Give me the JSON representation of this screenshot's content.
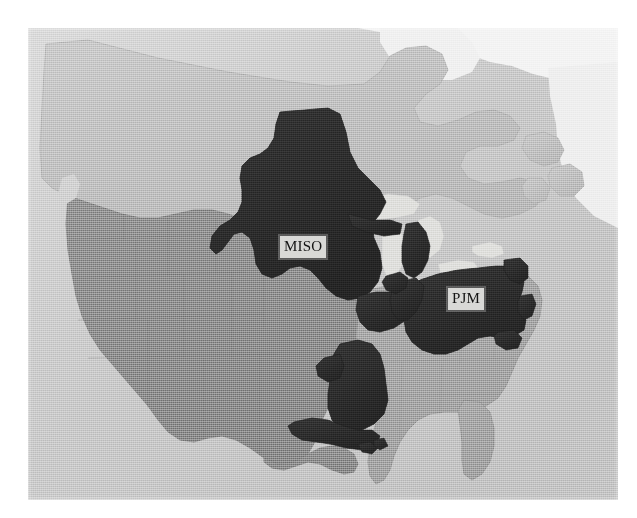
{
  "figure": {
    "kind": "map",
    "width": 637,
    "height": 518,
    "background_color": "#ffffff"
  },
  "map": {
    "plate": {
      "left": 28,
      "top": 28,
      "width": 590,
      "height": 472
    },
    "colors": {
      "page_background": "#ffffff",
      "ocean": "#c9c9c9",
      "water_light": "#e6e6e6",
      "great_lakes": "#d2d2d2",
      "canada_fill": "#bdbdbd",
      "us_base_fill": "#8c8c8c",
      "southeast_fill": "#a3a3a3",
      "rto_highlight_fill": "#2b2b2b",
      "state_border": "#7a7a7a",
      "label_box_fill": "#d8d8d6",
      "label_box_border": "#5a5a5a",
      "label_text": "#141414"
    },
    "labels": [
      {
        "id": "miso",
        "text": "MISO",
        "x": 279,
        "y": 235,
        "region": "Midcontinent Independent System Operator"
      },
      {
        "id": "pjm",
        "text": "PJM",
        "x": 447,
        "y": 287,
        "region": "PJM Interconnection"
      }
    ],
    "regions": [
      {
        "id": "miso-north",
        "name": "MISO northern footprint",
        "shade": "rto_highlight_fill"
      },
      {
        "id": "miso-south",
        "name": "MISO southern footprint",
        "shade": "rto_highlight_fill"
      },
      {
        "id": "pjm",
        "name": "PJM footprint",
        "shade": "rto_highlight_fill"
      },
      {
        "id": "western-us",
        "name": "Western United States",
        "shade": "us_base_fill"
      },
      {
        "id": "southeast-us",
        "name": "Southeastern United States",
        "shade": "southeast_fill"
      },
      {
        "id": "canada",
        "name": "Canada",
        "shade": "canada_fill"
      }
    ]
  }
}
